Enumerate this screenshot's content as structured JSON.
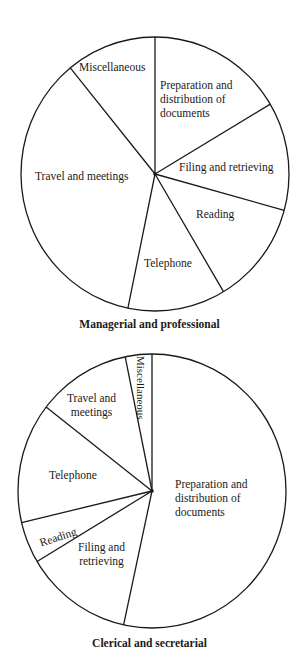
{
  "chart_data": [
    {
      "type": "pie",
      "title": "Managerial and professional",
      "start_angle_deg": 0,
      "direction": "clockwise",
      "categories": [
        "Preparation and distribution of documents",
        "Filing and retrieving",
        "Reading",
        "Telephone",
        "Travel and meetings",
        "Miscellaneous"
      ],
      "values": [
        16.5,
        12.8,
        12.2,
        11.8,
        35.9,
        10.9
      ],
      "units": "percent of time (estimated from slice angles)"
    },
    {
      "type": "pie",
      "title": "Clerical and secretarial",
      "start_angle_deg": 0,
      "direction": "clockwise",
      "categories": [
        "Preparation and distribution of documents",
        "Filing and retrieving",
        "Reading",
        "Telephone",
        "Travel and meetings",
        "Miscellaneous"
      ],
      "values": [
        53.4,
        13.0,
        4.9,
        14.2,
        11.3,
        3.2
      ],
      "units": "percent of time (estimated from slice angles)"
    }
  ],
  "charts": [
    {
      "title": "Managerial and professional",
      "labels": {
        "preparation": [
          "Preparation and",
          "distribution of",
          "documents"
        ],
        "filing": "Filing and retrieving",
        "reading": "Reading",
        "telephone": "Telephone",
        "travel": "Travel and meetings",
        "misc": "Miscellaneous"
      }
    },
    {
      "title": "Clerical and secretarial",
      "labels": {
        "preparation": [
          "Preparation and",
          "distribution of",
          "documents"
        ],
        "filing": [
          "Filing and",
          "retrieving"
        ],
        "reading": "Reading",
        "telephone": "Telephone",
        "travel": [
          "Travel and",
          "meetings"
        ],
        "misc": "Miscellaneous"
      }
    }
  ]
}
